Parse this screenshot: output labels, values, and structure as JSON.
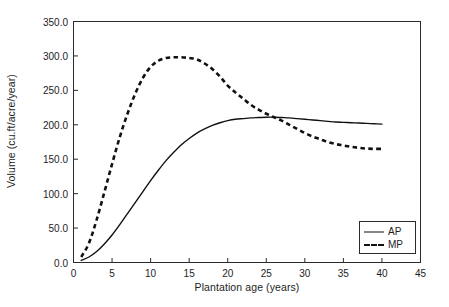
{
  "chart_data": {
    "type": "line",
    "title": "",
    "xlabel": "Plantation age (years)",
    "ylabel": "Volume (cu.ft/acre/year)",
    "xlim": [
      0,
      45
    ],
    "ylim": [
      0,
      350
    ],
    "xticks": [
      "0",
      "5",
      "10",
      "15",
      "20",
      "25",
      "30",
      "35",
      "40",
      "45"
    ],
    "yticks": [
      "0.0",
      "50.0",
      "100.0",
      "150.0",
      "200.0",
      "250.0",
      "300.0",
      "350.0"
    ],
    "grid": false,
    "legend_position": "lower right",
    "x": [
      1,
      2,
      3,
      4,
      5,
      6,
      7,
      8,
      9,
      10,
      11,
      12,
      13,
      14,
      15,
      16,
      17,
      18,
      19,
      20,
      21,
      22,
      23,
      24,
      25,
      26,
      27,
      28,
      29,
      30,
      31,
      32,
      33,
      34,
      35,
      36,
      37,
      38,
      39,
      40
    ],
    "series": [
      {
        "name": "AP",
        "style": "solid",
        "values": [
          3,
          8,
          16,
          27,
          40,
          55,
          71,
          87,
          103,
          119,
          134,
          148,
          160,
          171,
          180,
          188,
          194,
          199,
          203,
          206,
          208,
          209,
          210,
          210.5,
          211,
          211,
          210.5,
          210,
          209,
          208,
          207,
          206,
          205,
          204,
          203.5,
          203,
          202.5,
          202,
          201.5,
          201
        ]
      },
      {
        "name": "MP",
        "style": "dashed",
        "values": [
          8,
          28,
          62,
          102,
          143,
          182,
          216,
          245,
          268,
          284,
          293,
          297,
          298,
          298,
          297,
          295,
          289,
          281,
          270,
          257,
          247,
          238,
          229,
          222,
          216,
          211,
          206,
          200,
          194,
          188,
          183,
          179,
          175,
          172,
          170,
          168,
          166.5,
          165.5,
          165,
          165
        ]
      }
    ],
    "annotations": []
  },
  "legend": {
    "entries": [
      {
        "label": "AP"
      },
      {
        "label": "MP"
      }
    ]
  }
}
